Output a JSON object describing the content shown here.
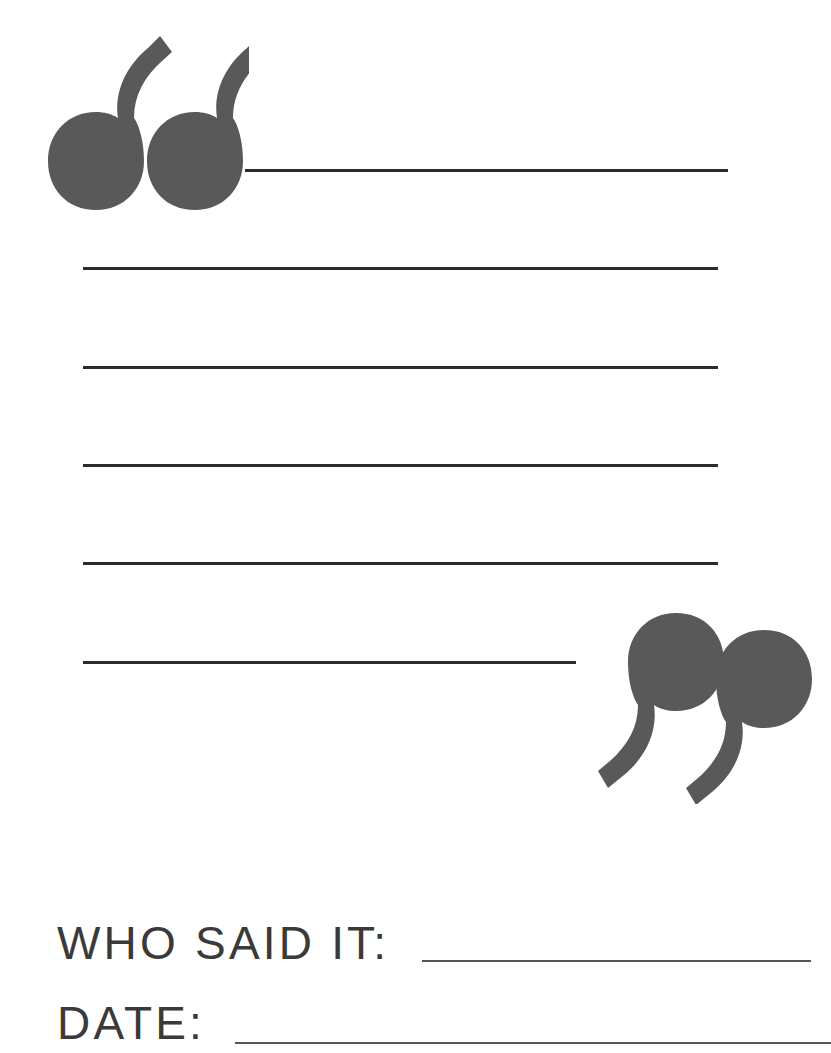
{
  "page": {
    "width": 831,
    "height": 1053,
    "background_color": "#ffffff"
  },
  "marks": {
    "opening_quote": {
      "icon": "opening-quotation-mark-icon",
      "character": "“",
      "color": "#595959"
    },
    "closing_quote": {
      "icon": "closing-quotation-mark-icon",
      "character": "”",
      "color": "#595959"
    }
  },
  "writing_area": {
    "line_color": "#2b2b2b",
    "line_count": 6,
    "lines": [
      {
        "id": "line-1",
        "value": ""
      },
      {
        "id": "line-2",
        "value": ""
      },
      {
        "id": "line-3",
        "value": ""
      },
      {
        "id": "line-4",
        "value": ""
      },
      {
        "id": "line-5",
        "value": ""
      },
      {
        "id": "line-6",
        "value": ""
      }
    ]
  },
  "footer": {
    "fields": [
      {
        "id": "who-said-it",
        "label": "WHO SAID IT:",
        "value": "",
        "underline_color": "#555555"
      },
      {
        "id": "date",
        "label": "DATE:",
        "value": "",
        "underline_color": "#555555"
      }
    ]
  }
}
